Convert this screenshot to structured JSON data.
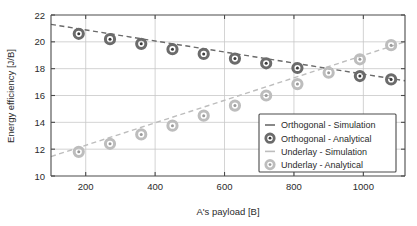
{
  "chart_data": {
    "type": "scatter",
    "title": "",
    "xlabel": "A's payload [B]",
    "ylabel": "Energy efficiency [J/B]",
    "xlim": [
      100,
      1120
    ],
    "ylim": [
      10,
      22
    ],
    "xticks": [
      200,
      400,
      600,
      800,
      1000
    ],
    "yticks": [
      10,
      12,
      14,
      16,
      18,
      20,
      22
    ],
    "grid": true,
    "legend_position": "lower-right",
    "series": [
      {
        "name": "Orthogonal - Simulation",
        "kind": "line",
        "style": "dashed",
        "color": "#6b6b6b",
        "x": [
          100,
          1120
        ],
        "values": [
          21.3,
          17.1
        ]
      },
      {
        "name": "Orthogonal - Analytical",
        "kind": "marker",
        "color": "#6b6b6b",
        "x": [
          180,
          270,
          360,
          450,
          540,
          630,
          720,
          810,
          990,
          1080
        ],
        "values": [
          20.6,
          20.2,
          19.85,
          19.45,
          19.1,
          18.75,
          18.4,
          18.05,
          17.45,
          17.2
        ]
      },
      {
        "name": "Underlay - Simulation",
        "kind": "line",
        "style": "dashed",
        "color": "#bdbdbd",
        "x": [
          100,
          1120
        ],
        "values": [
          11.45,
          20.0
        ]
      },
      {
        "name": "Underlay - Analytical",
        "kind": "marker",
        "color": "#bdbdbd",
        "x": [
          180,
          270,
          360,
          450,
          540,
          630,
          720,
          810,
          900,
          990,
          1080
        ],
        "values": [
          11.8,
          12.4,
          13.1,
          13.75,
          14.5,
          15.25,
          16.0,
          16.85,
          17.7,
          18.7,
          19.75
        ]
      }
    ],
    "legend_entries": [
      {
        "label": "Orthogonal - Simulation",
        "marker": "dash",
        "color": "#6b6b6b"
      },
      {
        "label": "Orthogonal - Analytical",
        "marker": "circle",
        "color": "#6b6b6b"
      },
      {
        "label": "Underlay - Simulation",
        "marker": "dash",
        "color": "#bdbdbd"
      },
      {
        "label": "Underlay - Analytical",
        "marker": "circle",
        "color": "#bdbdbd"
      }
    ]
  },
  "colors": {
    "orthogonal": "#6b6b6b",
    "underlay": "#bdbdbd",
    "grid": "#c8c8c8",
    "axis": "#4a4a4a",
    "text": "#2b2b2b",
    "background": "#ffffff"
  }
}
